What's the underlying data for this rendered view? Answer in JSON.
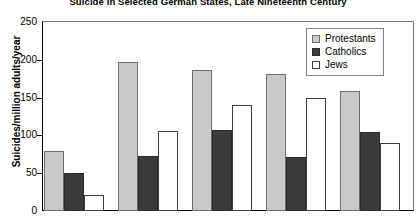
{
  "chart_data": {
    "type": "bar",
    "title": "Suicide in Selected German States, Late Nineteenth Century",
    "xlabel": "",
    "ylabel": "Suicides/million adults/year",
    "ylim": [
      0,
      250
    ],
    "yticks": [
      0,
      50,
      100,
      150,
      200,
      250
    ],
    "grid": false,
    "legend_position": "top-right",
    "categories": [
      "",
      "",
      "",
      "",
      ""
    ],
    "series": [
      {
        "name": "Protestants",
        "color": "#c9c9c9",
        "values": [
          80,
          197,
          186,
          181,
          159
        ]
      },
      {
        "name": "Catholics",
        "color": "#3b3b3b",
        "values": [
          50,
          73,
          107,
          72,
          105
        ]
      },
      {
        "name": "Jews",
        "color": "#ffffff",
        "values": [
          21,
          106,
          140,
          150,
          90
        ]
      }
    ]
  },
  "legend": {
    "items": [
      {
        "label": "Protestants",
        "swatch": "protestants"
      },
      {
        "label": "Catholics",
        "swatch": "catholics"
      },
      {
        "label": "Jews",
        "swatch": "jews"
      }
    ]
  }
}
